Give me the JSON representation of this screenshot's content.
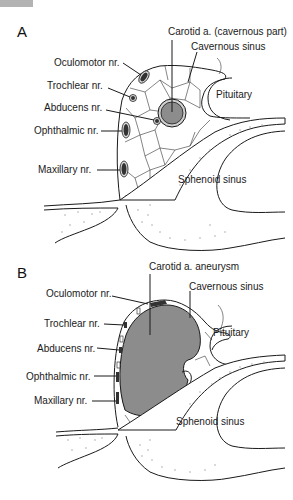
{
  "figure": {
    "top_bar_color": "#b3b3b3",
    "aneurysm_fill": "#8c8c8c",
    "carotid_fill": "#8c8c8c",
    "nerve_fill": "#333333"
  },
  "panel_a": {
    "letter": "A",
    "labels": {
      "carotid": "Carotid a. (cavernous part)",
      "cavernous_sinus": "Cavernous sinus",
      "oculomotor": "Oculomotor nr.",
      "trochlear": "Trochlear nr.",
      "abducens": "Abducens nr.",
      "pituitary": "Pituitary",
      "ophthalmic": "Ophthalmic nr.",
      "maxillary": "Maxillary nr.",
      "sphenoid_sinus": "Sphenoid sinus"
    }
  },
  "panel_b": {
    "letter": "B",
    "labels": {
      "carotid_aneurysm": "Carotid a. aneurysm",
      "oculomotor": "Oculomotor nr.",
      "cavernous_sinus": "Cavernous sinus",
      "trochlear": "Trochlear nr.",
      "pituitary": "Pituitary",
      "abducens": "Abducens nr.",
      "ophthalmic": "Ophthalmic nr.",
      "maxillary": "Maxillary nr.",
      "sphenoid_sinus": "Sphenoid sinus"
    }
  }
}
